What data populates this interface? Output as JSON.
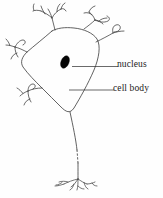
{
  "figure": {
    "background_color": "#fefefe",
    "ink_color": "#3a3a3a",
    "nucleus_fill": "#050505",
    "width": 163,
    "height": 198
  },
  "labels": {
    "nucleus": "nucleus",
    "cell_body": "cell body"
  },
  "parts": {
    "soma": "cell body",
    "nucleus": "nucleus",
    "dendrites": "dendrites",
    "axon": "axon",
    "axon_terminals": "axon terminals"
  },
  "leader_lines": {
    "nucleus_line": "nucleus leader line",
    "cell_body_line": "cell body leader line"
  }
}
